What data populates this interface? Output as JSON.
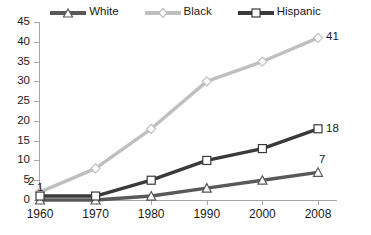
{
  "chart_data": {
    "type": "line",
    "title": "",
    "xlabel": "",
    "ylabel": "",
    "categories": [
      "1960",
      "1970",
      "1980",
      "1990",
      "2000",
      "2008"
    ],
    "ylim": [
      0,
      45
    ],
    "ytick_step": 5,
    "yticks": [
      "45",
      "40",
      "35",
      "30",
      "25",
      "20",
      "15",
      "10",
      "5",
      "0"
    ],
    "grid": false,
    "legend_position": "top",
    "series": [
      {
        "name": "White",
        "color": "#595959",
        "marker": "triangle",
        "values": [
          0,
          0,
          1,
          3,
          5,
          7
        ]
      },
      {
        "name": "Black",
        "color": "#bfbfbf",
        "marker": "diamond",
        "values": [
          2,
          8,
          18,
          30,
          35,
          41
        ]
      },
      {
        "name": "Hispanic",
        "color": "#3a3a3a",
        "marker": "square",
        "values": [
          1,
          1,
          5,
          10,
          13,
          18
        ]
      }
    ],
    "annotations": [
      {
        "text": "2",
        "series": "Black",
        "category": "1960"
      },
      {
        "text": "1",
        "series": "Hispanic",
        "category": "1960"
      },
      {
        "text": "41",
        "series": "Black",
        "category": "2008"
      },
      {
        "text": "18",
        "series": "Hispanic",
        "category": "2008"
      },
      {
        "text": "7",
        "series": "White",
        "category": "2008"
      }
    ]
  }
}
